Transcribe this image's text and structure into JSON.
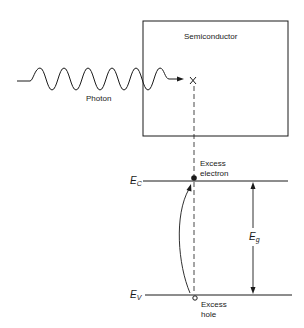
{
  "diagram": {
    "labels": {
      "semiconductor": "Semiconductor",
      "photon": "Photon",
      "photon_marker": "X",
      "excess_electron_line1": "Excess",
      "excess_electron_line2": "electron",
      "excess_hole_line1": "Excess",
      "excess_hole_line2": "hole"
    },
    "symbols": {
      "conduction_band": {
        "main": "E",
        "sub": "C"
      },
      "valence_band": {
        "main": "E",
        "sub": "V"
      },
      "band_gap": {
        "main": "E",
        "sub": "g"
      }
    },
    "colors": {
      "line": "#1a1a1a",
      "background": "#ffffff"
    }
  }
}
